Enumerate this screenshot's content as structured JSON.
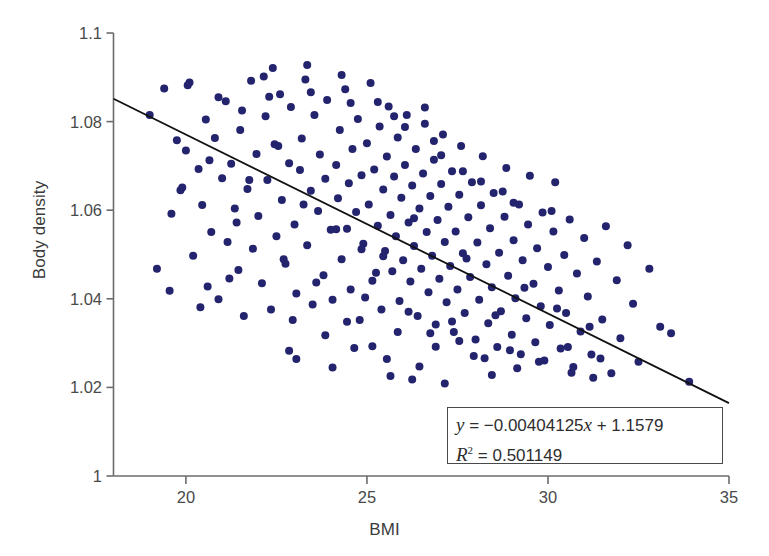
{
  "chart_data": {
    "type": "scatter",
    "title": "",
    "xlabel": "BMI",
    "ylabel": "Body density",
    "xlim": [
      18,
      35
    ],
    "ylim": [
      1.0,
      1.1
    ],
    "xticks": [
      20,
      25,
      30,
      35
    ],
    "xtick_labels": [
      "20",
      "25",
      "30",
      "35"
    ],
    "yticks": [
      1.0,
      1.02,
      1.04,
      1.06,
      1.08,
      1.1
    ],
    "ytick_labels": [
      "1",
      "1.02",
      "1.04",
      "1.06",
      "1.08",
      "1.1"
    ],
    "grid": false,
    "legend": "none",
    "marker_color": "#24246e",
    "marker_size_px": 8,
    "line_color": "#111111",
    "axis_color": "#6b6b6b",
    "trendline": {
      "slope": -0.00404125,
      "intercept": 1.1579,
      "r_squared": 0.501149,
      "x_start": 18,
      "x_end": 35,
      "y_start": 1.0852,
      "y_end": 1.016
    },
    "annotation": {
      "equation_y": "y",
      "equation_rest": " = −0.00404125",
      "equation_x": "x",
      "equation_tail": " + 1.1579",
      "r2_symbol": "R",
      "r2_sup": "2",
      "r2_value": " = 0.501149",
      "equation_full": "y = −0.00404125x + 1.1579",
      "r2_full": "R² = 0.501149"
    },
    "n_points": 252,
    "points": [
      [
        19.0,
        1.0815
      ],
      [
        19.2,
        1.0468
      ],
      [
        19.4,
        1.0875
      ],
      [
        19.6,
        1.0592
      ],
      [
        19.75,
        1.0758
      ],
      [
        19.85,
        1.0645
      ],
      [
        20.0,
        1.0735
      ],
      [
        20.1,
        1.0888
      ],
      [
        20.2,
        1.0497
      ],
      [
        20.35,
        1.0693
      ],
      [
        20.45,
        1.0612
      ],
      [
        20.55,
        1.0805
      ],
      [
        20.6,
        1.0428
      ],
      [
        20.7,
        1.0551
      ],
      [
        20.8,
        1.0763
      ],
      [
        20.9,
        1.0399
      ],
      [
        21.0,
        1.0672
      ],
      [
        21.1,
        1.0846
      ],
      [
        21.15,
        1.0528
      ],
      [
        21.25,
        1.0705
      ],
      [
        21.35,
        1.0604
      ],
      [
        21.45,
        1.0465
      ],
      [
        21.5,
        1.0781
      ],
      [
        21.6,
        1.0361
      ],
      [
        21.7,
        1.0648
      ],
      [
        21.8,
        1.0892
      ],
      [
        21.85,
        1.0513
      ],
      [
        21.95,
        1.0727
      ],
      [
        22.0,
        1.0587
      ],
      [
        22.1,
        1.0435
      ],
      [
        22.2,
        1.0812
      ],
      [
        22.25,
        1.0668
      ],
      [
        22.35,
        1.0376
      ],
      [
        22.45,
        1.0749
      ],
      [
        22.5,
        1.0541
      ],
      [
        22.6,
        1.0862
      ],
      [
        22.65,
        1.0623
      ],
      [
        22.75,
        1.0479
      ],
      [
        22.85,
        1.0706
      ],
      [
        22.9,
        1.0833
      ],
      [
        23.0,
        1.0568
      ],
      [
        23.05,
        1.0412
      ],
      [
        23.15,
        1.0691
      ],
      [
        23.2,
        1.0762
      ],
      [
        23.3,
        1.0895
      ],
      [
        23.35,
        1.0521
      ],
      [
        23.45,
        1.0644
      ],
      [
        23.5,
        1.0387
      ],
      [
        23.55,
        1.0815
      ],
      [
        23.65,
        1.0598
      ],
      [
        23.7,
        1.0726
      ],
      [
        23.8,
        1.0453
      ],
      [
        23.85,
        1.0671
      ],
      [
        23.9,
        1.0849
      ],
      [
        24.0,
        1.0556
      ],
      [
        24.05,
        1.0398
      ],
      [
        24.15,
        1.0702
      ],
      [
        24.2,
        1.0627
      ],
      [
        24.25,
        1.0781
      ],
      [
        24.3,
        1.0489
      ],
      [
        24.4,
        1.0873
      ],
      [
        24.45,
        1.0558
      ],
      [
        24.5,
        1.0661
      ],
      [
        24.55,
        1.0421
      ],
      [
        24.6,
        1.0738
      ],
      [
        24.7,
        1.0596
      ],
      [
        24.75,
        1.0806
      ],
      [
        24.8,
        1.0352
      ],
      [
        24.85,
        1.0679
      ],
      [
        24.9,
        1.0524
      ],
      [
        25.0,
        1.0751
      ],
      [
        25.05,
        1.0613
      ],
      [
        25.1,
        1.0887
      ],
      [
        25.15,
        1.0441
      ],
      [
        25.2,
        1.0692
      ],
      [
        25.3,
        1.0565
      ],
      [
        25.35,
        1.0789
      ],
      [
        25.4,
        1.0376
      ],
      [
        25.45,
        1.0647
      ],
      [
        25.5,
        1.0508
      ],
      [
        25.55,
        1.0721
      ],
      [
        25.6,
        1.0834
      ],
      [
        25.65,
        1.0589
      ],
      [
        25.7,
        1.0462
      ],
      [
        25.75,
        1.0676
      ],
      [
        25.8,
        1.0541
      ],
      [
        25.85,
        1.0764
      ],
      [
        25.9,
        1.0395
      ],
      [
        25.95,
        1.0628
      ],
      [
        26.0,
        1.0487
      ],
      [
        26.05,
        1.0702
      ],
      [
        26.1,
        1.0815
      ],
      [
        26.15,
        1.0572
      ],
      [
        26.2,
        1.0439
      ],
      [
        26.25,
        1.0656
      ],
      [
        26.3,
        1.0519
      ],
      [
        26.35,
        1.0738
      ],
      [
        26.4,
        1.0361
      ],
      [
        26.45,
        1.0604
      ],
      [
        26.5,
        1.0468
      ],
      [
        26.55,
        1.0683
      ],
      [
        26.6,
        1.0795
      ],
      [
        26.65,
        1.0551
      ],
      [
        26.7,
        1.0415
      ],
      [
        26.75,
        1.0632
      ],
      [
        26.8,
        1.0497
      ],
      [
        26.85,
        1.0714
      ],
      [
        26.9,
        1.0342
      ],
      [
        26.95,
        1.0578
      ],
      [
        27.0,
        1.0445
      ],
      [
        27.05,
        1.0659
      ],
      [
        27.1,
        1.0771
      ],
      [
        27.15,
        1.0528
      ],
      [
        27.2,
        1.0392
      ],
      [
        27.25,
        1.0608
      ],
      [
        27.3,
        1.0474
      ],
      [
        27.35,
        1.0688
      ],
      [
        27.4,
        1.0325
      ],
      [
        27.45,
        1.0552
      ],
      [
        27.5,
        1.0421
      ],
      [
        27.55,
        1.0635
      ],
      [
        27.6,
        1.0745
      ],
      [
        27.65,
        1.0503
      ],
      [
        27.7,
        1.0368
      ],
      [
        27.8,
        1.0584
      ],
      [
        27.85,
        1.0449
      ],
      [
        27.9,
        1.0663
      ],
      [
        28.0,
        1.0308
      ],
      [
        28.05,
        1.0527
      ],
      [
        28.1,
        1.0398
      ],
      [
        28.15,
        1.0611
      ],
      [
        28.2,
        1.0722
      ],
      [
        28.3,
        1.0478
      ],
      [
        28.35,
        1.0345
      ],
      [
        28.4,
        1.0559
      ],
      [
        28.45,
        1.0426
      ],
      [
        28.5,
        1.0639
      ],
      [
        28.6,
        1.0291
      ],
      [
        28.65,
        1.0504
      ],
      [
        28.7,
        1.0372
      ],
      [
        28.8,
        1.0585
      ],
      [
        28.85,
        1.0695
      ],
      [
        28.9,
        1.0452
      ],
      [
        29.0,
        1.0319
      ],
      [
        29.05,
        1.0532
      ],
      [
        29.1,
        1.0401
      ],
      [
        29.2,
        1.0613
      ],
      [
        29.25,
        1.0275
      ],
      [
        29.3,
        1.0487
      ],
      [
        29.4,
        1.0356
      ],
      [
        29.45,
        1.0568
      ],
      [
        29.5,
        1.0678
      ],
      [
        29.6,
        1.0434
      ],
      [
        29.65,
        1.0302
      ],
      [
        29.7,
        1.0514
      ],
      [
        29.8,
        1.0383
      ],
      [
        29.85,
        1.0595
      ],
      [
        29.9,
        1.0261
      ],
      [
        30.0,
        1.0472
      ],
      [
        30.05,
        1.0341
      ],
      [
        30.15,
        1.0552
      ],
      [
        30.2,
        1.0663
      ],
      [
        30.3,
        1.0419
      ],
      [
        30.35,
        1.0288
      ],
      [
        30.45,
        1.0499
      ],
      [
        30.5,
        1.0368
      ],
      [
        30.6,
        1.0579
      ],
      [
        30.7,
        1.0246
      ],
      [
        30.8,
        1.0457
      ],
      [
        30.9,
        1.0326
      ],
      [
        31.0,
        1.0537
      ],
      [
        31.1,
        1.0405
      ],
      [
        31.2,
        1.0274
      ],
      [
        31.35,
        1.0484
      ],
      [
        31.5,
        1.0353
      ],
      [
        31.6,
        1.0564
      ],
      [
        31.75,
        1.0232
      ],
      [
        31.9,
        1.0442
      ],
      [
        32.0,
        1.0311
      ],
      [
        32.2,
        1.0521
      ],
      [
        32.35,
        1.0389
      ],
      [
        32.5,
        1.0258
      ],
      [
        32.8,
        1.0468
      ],
      [
        33.1,
        1.0337
      ],
      [
        33.4,
        1.0322
      ],
      [
        33.9,
        1.0213
      ],
      [
        22.4,
        1.0921
      ],
      [
        23.35,
        1.0928
      ],
      [
        24.3,
        1.0905
      ],
      [
        26.6,
        1.0832
      ],
      [
        22.15,
        1.0902
      ],
      [
        20.05,
        1.0882
      ],
      [
        24.85,
        1.0512
      ],
      [
        25.25,
        1.0459
      ],
      [
        26.3,
        1.0582
      ],
      [
        27.75,
        1.0491
      ],
      [
        28.55,
        1.0363
      ],
      [
        29.35,
        1.0425
      ],
      [
        30.25,
        1.0378
      ],
      [
        31.15,
        1.0337
      ],
      [
        21.4,
        1.0572
      ],
      [
        22.7,
        1.0489
      ],
      [
        23.6,
        1.0437
      ],
      [
        24.95,
        1.0403
      ],
      [
        25.85,
        1.0325
      ],
      [
        26.9,
        1.0292
      ],
      [
        27.95,
        1.0271
      ],
      [
        19.9,
        1.0651
      ],
      [
        20.65,
        1.0713
      ],
      [
        21.75,
        1.0668
      ],
      [
        22.55,
        1.0745
      ],
      [
        23.25,
        1.0613
      ],
      [
        24.15,
        1.0557
      ],
      [
        25.45,
        1.0496
      ],
      [
        26.15,
        1.0371
      ],
      [
        27.35,
        1.0349
      ],
      [
        28.25,
        1.0266
      ],
      [
        29.15,
        1.0243
      ],
      [
        30.55,
        1.0291
      ],
      [
        31.45,
        1.0265
      ],
      [
        22.95,
        1.0352
      ],
      [
        23.85,
        1.0318
      ],
      [
        24.65,
        1.0289
      ],
      [
        25.55,
        1.0264
      ],
      [
        26.45,
        1.0247
      ],
      [
        21.2,
        1.0446
      ],
      [
        20.4,
        1.0381
      ],
      [
        19.55,
        1.0418
      ],
      [
        24.45,
        1.0348
      ],
      [
        25.15,
        1.0293
      ],
      [
        26.75,
        1.0322
      ],
      [
        27.55,
        1.0305
      ],
      [
        28.95,
        1.0284
      ],
      [
        29.75,
        1.0258
      ],
      [
        30.65,
        1.0233
      ],
      [
        31.25,
        1.0222
      ],
      [
        23.05,
        1.0264
      ],
      [
        22.85,
        1.0283
      ],
      [
        24.05,
        1.0245
      ],
      [
        25.65,
        1.0226
      ],
      [
        26.25,
        1.0218
      ],
      [
        27.15,
        1.0209
      ],
      [
        28.45,
        1.0228
      ],
      [
        20.9,
        1.0855
      ],
      [
        21.55,
        1.0825
      ],
      [
        22.3,
        1.0856
      ],
      [
        23.45,
        1.0866
      ],
      [
        25.3,
        1.0844
      ],
      [
        26.05,
        1.0788
      ],
      [
        27.05,
        1.0724
      ],
      [
        28.15,
        1.0665
      ],
      [
        29.05,
        1.0617
      ],
      [
        30.1,
        1.0598
      ],
      [
        24.55,
        1.0842
      ],
      [
        25.75,
        1.0812
      ],
      [
        26.85,
        1.0756
      ],
      [
        27.65,
        1.0688
      ],
      [
        28.75,
        1.0642
      ]
    ]
  }
}
